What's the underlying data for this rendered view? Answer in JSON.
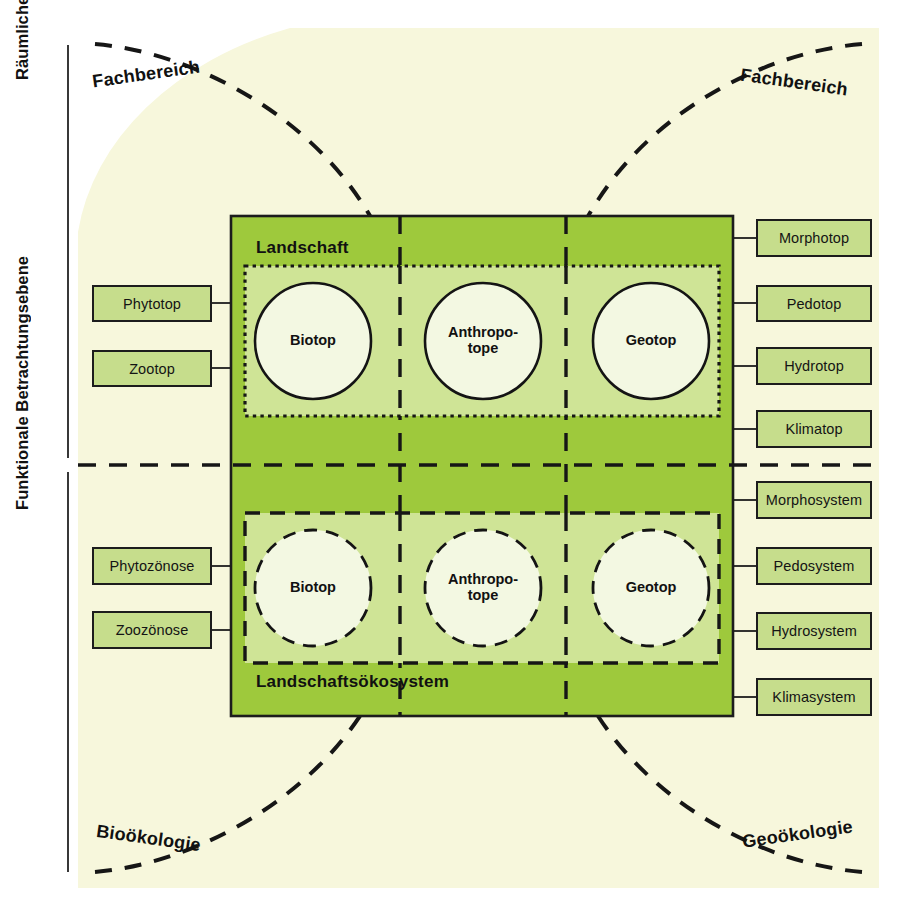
{
  "figure": {
    "title_present": false,
    "colors": {
      "cream_background": "#f7f7dc",
      "outer_green": "#9ec93c",
      "inner_green": "#cfe496",
      "leaf_box_fill": "#c6dd8c",
      "circle_fill": "#f3f8e2",
      "line_dark": "#1c1c1c"
    }
  },
  "axes": {
    "upper": {
      "label": "Räumliche Betrachtungsebene"
    },
    "lower": {
      "label": "Funktionale Betrachtungsebene"
    }
  },
  "discipline_labels": {
    "top_left": "Fachbereich",
    "top_right": "Fachbereich",
    "bottom_left": "Bioökologie",
    "bottom_right": "Geoökologie"
  },
  "zones": {
    "upper": {
      "title": "Landschaft"
    },
    "lower": {
      "title": "Landschaftsökosystem"
    }
  },
  "nodes": {
    "upper": [
      {
        "id": "biotop-upper",
        "label": "Biotop"
      },
      {
        "id": "anthropotope-upper",
        "label": "Anthropo-\ntope"
      },
      {
        "id": "geotop-upper",
        "label": "Geotop"
      }
    ],
    "lower": [
      {
        "id": "biotop-lower",
        "label": "Biotop"
      },
      {
        "id": "anthropotope-lower",
        "label": "Anthropo-\ntope"
      },
      {
        "id": "geotop-lower",
        "label": "Geotop"
      }
    ]
  },
  "left_boxes": {
    "upper": [
      {
        "id": "phytotop",
        "label": "Phytotop"
      },
      {
        "id": "zootop",
        "label": "Zootop"
      }
    ],
    "lower": [
      {
        "id": "phytozoenose",
        "label": "Phytozönose"
      },
      {
        "id": "zoozoenose",
        "label": "Zoozönose"
      }
    ]
  },
  "right_boxes": {
    "upper": [
      {
        "id": "morphotop",
        "label": "Morphotop"
      },
      {
        "id": "pedotop",
        "label": "Pedotop"
      },
      {
        "id": "hydrotop",
        "label": "Hydrotop"
      },
      {
        "id": "klimatop",
        "label": "Klimatop"
      }
    ],
    "lower": [
      {
        "id": "morphosystem",
        "label": "Morphosystem"
      },
      {
        "id": "pedosystem",
        "label": "Pedosystem"
      },
      {
        "id": "hydrosystem",
        "label": "Hydrosystem"
      },
      {
        "id": "klimasystem",
        "label": "Klimasystem"
      }
    ]
  }
}
